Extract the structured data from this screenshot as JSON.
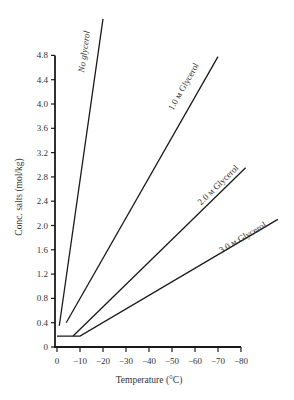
{
  "chart_data": {
    "type": "line",
    "title": "",
    "xlabel": "Temperature (°C)",
    "ylabel": "Conc. salts (mol/kg)",
    "xlim": [
      0,
      -80
    ],
    "ylim": [
      0,
      4.8
    ],
    "x_ticks": [
      0,
      -10,
      -20,
      -30,
      -40,
      -50,
      -60,
      -70,
      -80
    ],
    "x_tick_labels": [
      "0",
      "−10",
      "−20",
      "−30",
      "−40",
      "−50",
      "−60",
      "−70",
      "−80"
    ],
    "y_ticks": [
      0,
      0.4,
      0.8,
      1.2,
      1.6,
      2.0,
      2.4,
      2.8,
      3.2,
      3.6,
      4.0,
      4.4,
      4.8
    ],
    "y_tick_labels": [
      "0",
      "0.4",
      "0.8",
      "1.2",
      "1.6",
      "2.0",
      "2.4",
      "2.8",
      "3.2",
      "3.6",
      "4.0",
      "4.4",
      "4.8"
    ],
    "grid": false,
    "legend": "inline labels along lines",
    "series": [
      {
        "name": "No glycerol",
        "label": "No glycerol",
        "x": [
          -1,
          -20
        ],
        "y": [
          0.35,
          5.4
        ]
      },
      {
        "name": "1.0 M Glycerol",
        "label": "1.0 м Glycerol",
        "x": [
          -4,
          -70
        ],
        "y": [
          0.4,
          4.78
        ]
      },
      {
        "name": "2.0 M Glycerol",
        "label": "2.0 м Glycerol",
        "x": [
          -7,
          -82
        ],
        "y": [
          0.18,
          2.95
        ]
      },
      {
        "name": "3.0 M Glycerol",
        "label": "3.0 м Glycerol",
        "x": [
          0,
          -10,
          -96
        ],
        "y": [
          0.18,
          0.18,
          2.1
        ]
      }
    ]
  }
}
